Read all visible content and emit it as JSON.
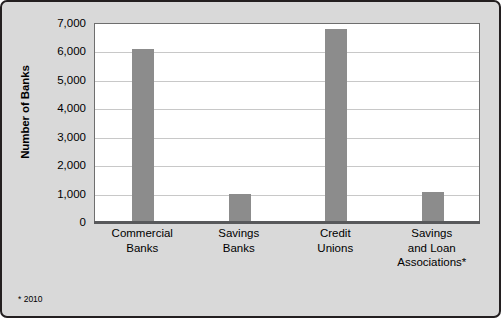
{
  "chart_data": {
    "type": "bar",
    "title": "",
    "subtitle": "",
    "xlabel": "",
    "ylabel": "Number of Banks",
    "categories": [
      "Commercial\nBanks",
      "Savings\nBanks",
      "Credit\nUnions",
      "Savings\nand Loan\nAssociations*"
    ],
    "category_lines": [
      [
        "Commercial",
        "Banks"
      ],
      [
        "Savings",
        "Banks"
      ],
      [
        "Credit",
        "Unions"
      ],
      [
        "Savings",
        "and Loan",
        "Associations*"
      ]
    ],
    "values": [
      6100,
      980,
      6800,
      1050
    ],
    "ylim": [
      0,
      7000
    ],
    "ytick_values": [
      0,
      1000,
      2000,
      3000,
      4000,
      5000,
      6000,
      7000
    ],
    "ytick_labels": [
      "0",
      "1,000",
      "2,000",
      "3,000",
      "4,000",
      "5,000",
      "6,000",
      "7,000"
    ],
    "grid": true,
    "legend": false,
    "legend_position": "none",
    "annotations": [
      "* 2010"
    ],
    "bar_color": "#8c8c8c",
    "plot_background": "#ffffff",
    "card_background": "#d9d9d9",
    "border_color": "#231f20",
    "gridline_color": "#c8c8c8",
    "axis_color": "#58595b"
  },
  "footnote": {
    "text": "* 2010"
  }
}
